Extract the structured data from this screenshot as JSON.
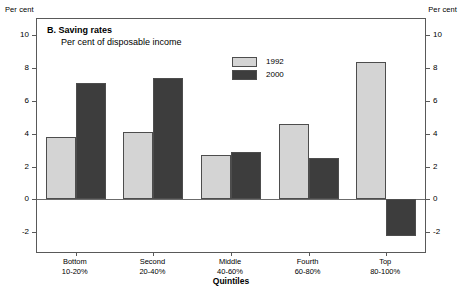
{
  "units": {
    "left": "Per cent",
    "right": "Per cent"
  },
  "titles": {
    "panel": "B. Saving rates",
    "subtitle": "Per cent of disposable income",
    "xaxis": "Quintiles"
  },
  "legend": {
    "position": "inside-top-center",
    "entries": [
      {
        "label": "1992",
        "color": "#d4d4d4"
      },
      {
        "label": "2000",
        "color": "#3d3d3d"
      }
    ]
  },
  "axis": {
    "y_ticks": [
      10,
      8,
      6,
      4,
      2,
      0,
      -2
    ],
    "y_tick_labels": [
      "10",
      "8",
      "6",
      "4",
      "2",
      "0",
      "-2"
    ],
    "ymin": -3.2,
    "ymax": 11.0
  },
  "chart_data": {
    "type": "bar",
    "title": "B. Saving rates",
    "subtitle": "Per cent of disposable income",
    "xlabel": "Quintiles",
    "ylabel": "Per cent",
    "ylim": [
      -3.2,
      11.0
    ],
    "yticks": [
      -2,
      0,
      2,
      4,
      6,
      8,
      10
    ],
    "grid": false,
    "legend": "inside top center",
    "categories": [
      {
        "name": "Bottom",
        "range": "10-20%"
      },
      {
        "name": "Second",
        "range": "20-40%"
      },
      {
        "name": "Middle",
        "range": "40-60%"
      },
      {
        "name": "Fourth",
        "range": "60-80%"
      },
      {
        "name": "Top",
        "range": "80-100%"
      }
    ],
    "series": [
      {
        "name": "1992",
        "color": "#d4d4d4",
        "values": [
          3.8,
          4.1,
          2.7,
          4.6,
          8.4
        ]
      },
      {
        "name": "2000",
        "color": "#3d3d3d",
        "values": [
          7.1,
          7.4,
          2.9,
          2.55,
          -2.2
        ]
      }
    ]
  }
}
